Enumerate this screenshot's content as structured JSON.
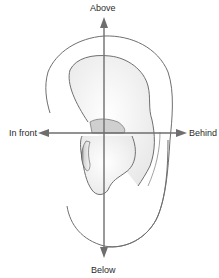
{
  "diagram": {
    "labels": {
      "above": "Above",
      "below": "Below",
      "in_front": "In front",
      "behind": "Behind"
    },
    "colors": {
      "axis": "#6e6e6e",
      "outline": "#6f6f6f",
      "fill": "#f3f3f3",
      "shadow": "#bdbdbd",
      "text": "#2b2b2b",
      "background": "#ffffff"
    }
  }
}
